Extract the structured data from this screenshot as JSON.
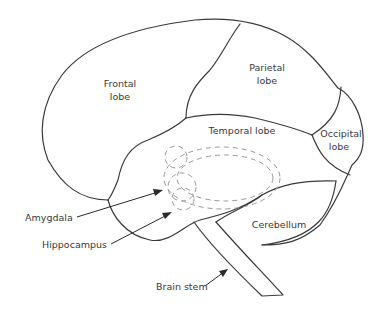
{
  "diagram": {
    "title": "",
    "labels": {
      "frontal": [
        "Frontal",
        "lobe"
      ],
      "parietal": [
        "Parietal",
        "lobe"
      ],
      "temporal": "Temporal lobe",
      "occipital": [
        "Occipital",
        "lobe"
      ],
      "cerebellum": "Cerebellum",
      "amygdala": "Amygdala",
      "hippocampus": "Hippocampus",
      "brain_stem": "Brain stem"
    },
    "colors": {
      "outline": "#3a3a3a",
      "dashed": "#9a9a9a",
      "text": "#3a3a3a",
      "background": "#ffffff"
    }
  }
}
